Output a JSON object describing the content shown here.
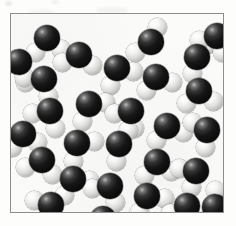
{
  "figure": {
    "kind": "space-filling-molecular-model-illustration",
    "molecule_formula": "H2O",
    "molecule_count": 28,
    "atoms_per_molecule": 3,
    "background_color": "#fbfbfa",
    "page_color": "#fdfdfc",
    "border_color": "#8d8d8d",
    "border_width_px": 1,
    "atom_legend": [
      {
        "element": "O",
        "name": "oxygen",
        "role": "central atom",
        "color": "#111111",
        "radius_px": 13
      },
      {
        "element": "H",
        "name": "hydrogen",
        "role": "terminal atom",
        "color": "#eeeeec",
        "radius_px": 9.5
      }
    ],
    "frame": {
      "left": 10,
      "top": 13,
      "width": 214,
      "height": 200
    },
    "scan_artifacts": [
      {
        "name": "top-left-speck"
      },
      {
        "name": "top-center-speck"
      },
      {
        "name": "top-smudge-right"
      },
      {
        "name": "top-smudge-left"
      }
    ],
    "molecules": [
      {
        "id": 1,
        "x": 36,
        "y": 24,
        "rot": -18,
        "h1": {
          "dx": -15,
          "dy": 10
        },
        "h2": {
          "dx": 10,
          "dy": 15
        }
      },
      {
        "id": 2,
        "x": 68,
        "y": 41,
        "rot": 12,
        "h1": {
          "dx": -15,
          "dy": 11
        },
        "h2": {
          "dx": 15,
          "dy": 8
        }
      },
      {
        "id": 3,
        "x": 33,
        "y": 65,
        "rot": 30,
        "h1": {
          "dx": -14,
          "dy": 12
        },
        "h2": {
          "dx": 13,
          "dy": 13
        }
      },
      {
        "id": 4,
        "x": 106,
        "y": 54,
        "rot": -25,
        "h1": {
          "dx": -13,
          "dy": 13
        },
        "h2": {
          "dx": 14,
          "dy": 10
        }
      },
      {
        "id": 5,
        "x": 140,
        "y": 28,
        "rot": 8,
        "h1": {
          "dx": -14,
          "dy": 13
        },
        "h2": {
          "dx": 4,
          "dy": -15
        }
      },
      {
        "id": 6,
        "x": 145,
        "y": 63,
        "rot": -40,
        "h1": {
          "dx": -16,
          "dy": 4
        },
        "h2": {
          "dx": 9,
          "dy": 15
        }
      },
      {
        "id": 7,
        "x": 186,
        "y": 43,
        "rot": 55,
        "h1": {
          "dx": -4,
          "dy": -16
        },
        "h2": {
          "dx": 11,
          "dy": 13
        }
      },
      {
        "id": 8,
        "x": 188,
        "y": 77,
        "rot": -12,
        "h1": {
          "dx": -15,
          "dy": 10
        },
        "h2": {
          "dx": 12,
          "dy": 13
        }
      },
      {
        "id": 9,
        "x": 39,
        "y": 97,
        "rot": 22,
        "h1": {
          "dx": -15,
          "dy": 9
        },
        "h2": {
          "dx": 12,
          "dy": 14
        }
      },
      {
        "id": 10,
        "x": 78,
        "y": 90,
        "rot": -30,
        "h1": {
          "dx": -14,
          "dy": 12
        },
        "h2": {
          "dx": 15,
          "dy": 7
        }
      },
      {
        "id": 11,
        "x": 120,
        "y": 97,
        "rot": 18,
        "h1": {
          "dx": -15,
          "dy": 8
        },
        "h2": {
          "dx": 9,
          "dy": 15
        }
      },
      {
        "id": 12,
        "x": 156,
        "y": 112,
        "rot": -20,
        "h1": {
          "dx": -15,
          "dy": 10
        },
        "h2": {
          "dx": 13,
          "dy": 12
        }
      },
      {
        "id": 13,
        "x": 196,
        "y": 116,
        "rot": 40,
        "h1": {
          "dx": -16,
          "dy": 3
        },
        "h2": {
          "dx": 10,
          "dy": 14
        }
      },
      {
        "id": 14,
        "x": 66,
        "y": 129,
        "rot": -35,
        "h1": {
          "dx": -13,
          "dy": 13
        },
        "h2": {
          "dx": 15,
          "dy": 9
        }
      },
      {
        "id": 15,
        "x": 31,
        "y": 146,
        "rot": 15,
        "h1": {
          "dx": -14,
          "dy": 11
        },
        "h2": {
          "dx": 14,
          "dy": 11
        }
      },
      {
        "id": 16,
        "x": 108,
        "y": 130,
        "rot": 60,
        "h1": {
          "dx": -7,
          "dy": -15
        },
        "h2": {
          "dx": 14,
          "dy": 11
        }
      },
      {
        "id": 17,
        "x": 146,
        "y": 148,
        "rot": -10,
        "h1": {
          "dx": -15,
          "dy": 11
        },
        "h2": {
          "dx": 13,
          "dy": 12
        }
      },
      {
        "id": 18,
        "x": 185,
        "y": 157,
        "rot": 35,
        "h1": {
          "dx": -15,
          "dy": 8
        },
        "h2": {
          "dx": 6,
          "dy": 16
        }
      },
      {
        "id": 19,
        "x": 62,
        "y": 165,
        "rot": -22,
        "h1": {
          "dx": -14,
          "dy": 12
        },
        "h2": {
          "dx": 15,
          "dy": 8
        }
      },
      {
        "id": 20,
        "x": 99,
        "y": 172,
        "rot": 25,
        "h1": {
          "dx": -15,
          "dy": 10
        },
        "h2": {
          "dx": 12,
          "dy": 13
        }
      },
      {
        "id": 21,
        "x": 136,
        "y": 182,
        "rot": -28,
        "h1": {
          "dx": -14,
          "dy": 11
        },
        "h2": {
          "dx": 14,
          "dy": 10
        }
      },
      {
        "id": 22,
        "x": 176,
        "y": 192,
        "rot": 10,
        "h1": {
          "dx": -15,
          "dy": 10
        },
        "h2": {
          "dx": 13,
          "dy": 12
        }
      },
      {
        "id": 23,
        "x": 40,
        "y": 191,
        "rot": 45,
        "h1": {
          "dx": -15,
          "dy": 9
        },
        "h2": {
          "dx": 8,
          "dy": 15
        }
      },
      {
        "id": 24,
        "x": 92,
        "y": 205,
        "rot": -15,
        "h1": {
          "dx": -14,
          "dy": 9
        },
        "h2": {
          "dx": 14,
          "dy": 9
        }
      },
      {
        "id": 25,
        "x": 12,
        "y": 120,
        "rot": -5,
        "h1": {
          "dx": -12,
          "dy": 13
        },
        "h2": {
          "dx": 14,
          "dy": 10
        }
      },
      {
        "id": 26,
        "x": 206,
        "y": 22,
        "rot": 20,
        "h1": {
          "dx": -15,
          "dy": 10
        },
        "h2": {
          "dx": 11,
          "dy": 14
        }
      },
      {
        "id": 27,
        "x": 8,
        "y": 48,
        "rot": 50,
        "h1": {
          "dx": -6,
          "dy": 15
        },
        "h2": {
          "dx": 15,
          "dy": 6
        }
      },
      {
        "id": 28,
        "x": 204,
        "y": 193,
        "rot": -45,
        "h1": {
          "dx": -14,
          "dy": 11
        },
        "h2": {
          "dx": 12,
          "dy": -12
        }
      }
    ]
  }
}
